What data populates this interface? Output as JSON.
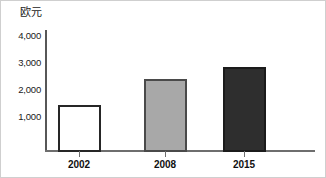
{
  "chart_data": {
    "type": "bar",
    "title": "",
    "subtitle": "",
    "xlabel": "",
    "ylabel": "欧元",
    "unit_label": "欧元",
    "categories": [
      "2002",
      "2008",
      "2015"
    ],
    "values": [
      1750,
      2700,
      3150
    ],
    "yticks": [
      "1,000",
      "2,000",
      "3,000",
      "4,000"
    ],
    "ytick_values": [
      1000,
      2000,
      3000,
      4000
    ],
    "ylim": [
      0,
      4000
    ],
    "grid": false,
    "legend": "none",
    "series": [
      {
        "name": "欧元",
        "values": [
          1750,
          2700,
          3150
        ]
      }
    ],
    "bars": [
      {
        "category": "2002",
        "value": 1750,
        "style": "open",
        "fill": "#ffffff",
        "stroke": "#262626"
      },
      {
        "category": "2008",
        "value": 2700,
        "style": "gray",
        "fill": "#a8a8a8",
        "stroke": "#4a4a4a"
      },
      {
        "category": "2015",
        "value": 3150,
        "style": "dark",
        "fill": "#2e2e2e",
        "stroke": "#1b1b1b"
      }
    ],
    "colors": {
      "background": "#ffffff",
      "axis": "#6e6e6e",
      "text": "#111111",
      "bar_open_fill": "#ffffff",
      "bar_gray_fill": "#a8a8a8",
      "bar_dark_fill": "#2e2e2e"
    }
  }
}
